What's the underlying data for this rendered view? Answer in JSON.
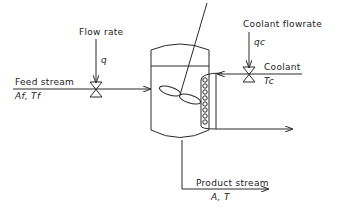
{
  "diagram": {
    "type": "process-flow",
    "labels": {
      "flow_rate": "Flow rate",
      "q": "q",
      "feed_stream": "Feed stream",
      "feed_vars": "Af, Tf",
      "coolant_flowrate": "Coolant flowrate",
      "qc": "qc",
      "coolant": "Coolant",
      "tc": "Tc",
      "product_stream": "Product stream",
      "product_vars": "A, T"
    },
    "components": [
      "feed-valve",
      "coolant-valve",
      "tank",
      "agitator",
      "cooling-coil",
      "coolant-outlet",
      "product-outlet"
    ]
  }
}
